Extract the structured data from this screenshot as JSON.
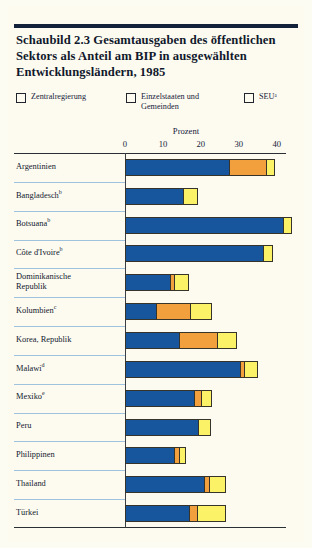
{
  "figure": {
    "title": "Schaubild 2.3   Gesamtausgaben des öffentlichen Sektors als Anteil am BIP in ausgewählten Entwicklungsländern, 1985",
    "axis_title": "Prozent"
  },
  "legend": [
    {
      "label": "Zentralregierung",
      "color": "#17559c",
      "name": "legend-central-government"
    },
    {
      "label": "Einzelstaaten und\nGemeinden",
      "color": "#f2a03d",
      "name": "legend-states-municipalities"
    },
    {
      "label": "SEUᵃ",
      "color": "#fbf268",
      "name": "legend-seu"
    }
  ],
  "chart_data": {
    "type": "bar",
    "orientation": "horizontal",
    "stacked": true,
    "title": "Schaubild 2.3   Gesamtausgaben des öffentlichen Sektors als Anteil am BIP in ausgewählten Entwicklungsländern, 1985",
    "xlabel": "Prozent",
    "ylabel": "",
    "xlim": [
      0,
      43
    ],
    "xticks": [
      0,
      10,
      20,
      30,
      40
    ],
    "xtick_labels": [
      "0",
      "10",
      "20",
      "30",
      "40"
    ],
    "grid": false,
    "legend_position": "top",
    "series": [
      {
        "name": "Zentralregierung",
        "color": "#17559c",
        "values": [
          27.2,
          15.0,
          41.4,
          36.0,
          11.7,
          7.9,
          14.0,
          30.0,
          18.0,
          18.9,
          12.7,
          20.5,
          16.7
        ]
      },
      {
        "name": "Einzelstaaten und Gemeinden",
        "color": "#f2a03d",
        "values": [
          9.8,
          0.0,
          0.0,
          0.0,
          1.0,
          9.1,
          10.0,
          1.2,
          1.8,
          0.0,
          1.3,
          1.5,
          2.0
        ]
      },
      {
        "name": "SEU",
        "color": "#fbf268",
        "values": [
          2.0,
          3.7,
          2.1,
          2.5,
          3.6,
          5.4,
          5.0,
          3.4,
          2.6,
          3.3,
          1.6,
          4.0,
          7.3
        ]
      }
    ],
    "categories": [
      "Argentinien",
      "Bangladeschᵇ",
      "Botsuanaᵇ",
      "Côte d'Ivoireᵇ",
      "Dominikanische Republik",
      "Kolumbienᶜ",
      "Korea, Republik",
      "Malawiᵈ",
      "Mexikoᵉ",
      "Peru",
      "Philippinen",
      "Thailand",
      "Türkei"
    ],
    "totals": [
      39.0,
      18.7,
      43.5,
      38.5,
      16.3,
      22.4,
      29.0,
      34.6,
      22.4,
      22.2,
      15.6,
      26.0,
      26.0
    ]
  },
  "rows": [
    {
      "label": "Argentinien",
      "footnote": "",
      "segments": [
        27.2,
        9.8,
        2.0
      ]
    },
    {
      "label": "Bangladesch",
      "footnote": "b",
      "segments": [
        15.0,
        0.0,
        3.7
      ]
    },
    {
      "label": "Botsuana",
      "footnote": "b",
      "segments": [
        41.4,
        0.0,
        2.1
      ]
    },
    {
      "label": "Côte d'Ivoire",
      "footnote": "b",
      "segments": [
        36.0,
        0.0,
        2.5
      ]
    },
    {
      "label": "Dominikanische\nRepublik",
      "footnote": "",
      "segments": [
        11.7,
        1.0,
        3.6
      ]
    },
    {
      "label": "Kolumbien",
      "footnote": "c",
      "segments": [
        7.9,
        9.1,
        5.4
      ]
    },
    {
      "label": "Korea, Republik",
      "footnote": "",
      "segments": [
        14.0,
        10.0,
        5.0
      ]
    },
    {
      "label": "Malawi",
      "footnote": "d",
      "segments": [
        30.0,
        1.2,
        3.4
      ]
    },
    {
      "label": "Mexiko",
      "footnote": "e",
      "segments": [
        18.0,
        1.8,
        2.6
      ]
    },
    {
      "label": "Peru",
      "footnote": "",
      "segments": [
        18.9,
        0.0,
        3.3
      ]
    },
    {
      "label": "Philippinen",
      "footnote": "",
      "segments": [
        12.7,
        1.3,
        1.6
      ]
    },
    {
      "label": "Thailand",
      "footnote": "",
      "segments": [
        20.5,
        1.5,
        4.0
      ]
    },
    {
      "label": "Türkei",
      "footnote": "",
      "segments": [
        16.7,
        2.0,
        7.3
      ]
    }
  ],
  "colors": {
    "central": "#17559c",
    "states": "#f2a03d",
    "seu": "#fbf268",
    "page": "#fdfbf0",
    "rule": "#14213a",
    "separator": "#9fc2de"
  }
}
